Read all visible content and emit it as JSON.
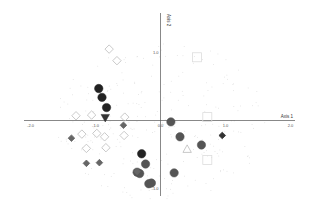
{
  "chart_data": {
    "type": "scatter",
    "title": "",
    "xlabel": "Axis 1",
    "ylabel": "Axis 2",
    "xlim": [
      -2.0,
      2.0
    ],
    "ylim": [
      -1.05,
      1.05
    ],
    "grid": false,
    "legend": null,
    "x_ticks": [
      {
        "value": -2.0,
        "label": "-2.0"
      },
      {
        "value": -1.0,
        "label": "-1.0"
      },
      {
        "value": 0.0,
        "label": "0.0"
      },
      {
        "value": 1.0,
        "label": "1.0"
      },
      {
        "value": 2.0,
        "label": "2.0"
      }
    ],
    "y_ticks": [
      {
        "value": 1.0,
        "label": "1.0"
      },
      {
        "value": -1.0,
        "label": "-1.0"
      }
    ],
    "series": [
      {
        "name": "black-circles",
        "marker": "circle",
        "filled": true,
        "color": "#222222",
        "size": 4.2,
        "points": [
          {
            "x": -0.95,
            "y": 0.47
          },
          {
            "x": -0.9,
            "y": 0.34
          },
          {
            "x": -0.83,
            "y": 0.19
          },
          {
            "x": -0.29,
            "y": -0.49
          }
        ]
      },
      {
        "name": "gray-circles",
        "marker": "circle",
        "filled": true,
        "color": "#555555",
        "size": 4.2,
        "points": [
          {
            "x": 0.16,
            "y": -0.02
          },
          {
            "x": 0.3,
            "y": -0.24
          },
          {
            "x": 0.63,
            "y": -0.36
          },
          {
            "x": -0.23,
            "y": -0.64
          },
          {
            "x": -0.36,
            "y": -0.76
          },
          {
            "x": -0.32,
            "y": -0.78
          },
          {
            "x": -0.18,
            "y": -0.93
          },
          {
            "x": -0.14,
            "y": -0.92
          },
          {
            "x": 0.21,
            "y": -0.77
          }
        ]
      },
      {
        "name": "black-triangle-down",
        "marker": "triangle-down",
        "filled": true,
        "color": "#333333",
        "size": 4.2,
        "points": [
          {
            "x": -0.85,
            "y": 0.04
          }
        ]
      },
      {
        "name": "gray-diamonds-filled",
        "marker": "diamond",
        "filled": true,
        "color": "#666666",
        "size": 3.3,
        "points": [
          {
            "x": -0.57,
            "y": -0.07
          },
          {
            "x": -1.37,
            "y": -0.26
          },
          {
            "x": -1.14,
            "y": -0.63
          },
          {
            "x": -0.94,
            "y": -0.62
          },
          {
            "x": -0.36,
            "y": -0.75
          }
        ]
      },
      {
        "name": "dark-diamond-filled",
        "marker": "diamond",
        "filled": true,
        "color": "#333333",
        "size": 3.3,
        "points": [
          {
            "x": 0.95,
            "y": -0.22
          }
        ]
      },
      {
        "name": "open-diamonds",
        "marker": "diamond",
        "filled": false,
        "color": "#bbbbbb",
        "size": 4.2,
        "points": [
          {
            "x": -0.79,
            "y": 1.05
          },
          {
            "x": -0.67,
            "y": 0.88
          },
          {
            "x": -1.3,
            "y": 0.07
          },
          {
            "x": -1.06,
            "y": 0.08
          },
          {
            "x": -0.55,
            "y": 0.05
          },
          {
            "x": -1.21,
            "y": -0.2
          },
          {
            "x": -0.98,
            "y": -0.19
          },
          {
            "x": -0.86,
            "y": -0.24
          },
          {
            "x": -0.56,
            "y": -0.22
          },
          {
            "x": -1.14,
            "y": -0.41
          },
          {
            "x": -0.84,
            "y": -0.4
          }
        ]
      },
      {
        "name": "open-triangle",
        "marker": "triangle-up",
        "filled": false,
        "color": "#bbbbbb",
        "size": 4.2,
        "points": [
          {
            "x": 0.41,
            "y": -0.42
          }
        ]
      },
      {
        "name": "open-squares",
        "marker": "square",
        "filled": false,
        "color": "#dddddd",
        "size": 4.5,
        "points": [
          {
            "x": 0.56,
            "y": 0.93
          },
          {
            "x": 0.72,
            "y": 0.05
          },
          {
            "x": 0.72,
            "y": -0.58
          }
        ]
      }
    ]
  }
}
